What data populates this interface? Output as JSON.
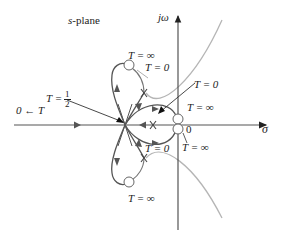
{
  "diagram": {
    "title": "s-plane",
    "axes": {
      "real_label": "σ",
      "imag_label": "jω",
      "origin_label": "0"
    },
    "labels": {
      "t_to_zero_left": "0 ← T",
      "t_half_prefix": "T =",
      "t_half_num": "1",
      "t_half_den": "2",
      "top_circle_t_inf": "T = ∞",
      "top_pole_t_zero": "T = 0",
      "real_pole_t_zero": "T = 0",
      "origin_zero_t_inf": "T = ∞",
      "origin_zero_t_inf_lower": "T = ∞",
      "bottom_pole_t_zero": "T = 0",
      "bottom_circle_t_inf": "T = ∞"
    },
    "colors": {
      "locus": "#555555",
      "asymptote": "#b0b0b0",
      "axis": "#333333",
      "text": "#222222"
    },
    "markers": {
      "poles": [
        "top-complex-pole",
        "real-pole",
        "bottom-complex-pole"
      ],
      "zeros": [
        "top-left-zero",
        "origin-zero-upper",
        "origin-zero-lower",
        "bottom-left-zero"
      ]
    }
  }
}
